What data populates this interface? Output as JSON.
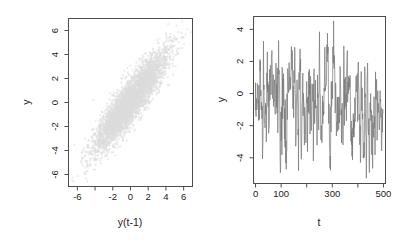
{
  "figure": {
    "background": "#ffffff",
    "axis_color": "#4d4d4d",
    "text_color": "#1a1a1a"
  },
  "panels": [
    {
      "id": "scatter",
      "x_title": "y(t-1)",
      "y_title": "y",
      "point_color": "#dcdcdc",
      "box": {
        "left": 68,
        "right": 192,
        "top": 18,
        "bottom": 186
      },
      "x_ticks": [
        -6,
        -4,
        -2,
        0,
        2,
        4,
        6
      ],
      "x_tick_labels": [
        "-6",
        "",
        "-2",
        "0",
        "2",
        "4",
        "6"
      ],
      "y_ticks": [
        -6,
        -4,
        -2,
        0,
        2,
        4,
        6
      ],
      "y_tick_labels": [
        "-6",
        "-4",
        "-2",
        "0",
        "2",
        "4",
        "6"
      ]
    },
    {
      "id": "series",
      "x_title": "t",
      "y_title": "y",
      "line_color": "#777777",
      "box": {
        "left": 253,
        "right": 385,
        "top": 16,
        "bottom": 183
      },
      "x_ticks": [
        0,
        100,
        200,
        300,
        400,
        500
      ],
      "x_tick_labels": [
        "0",
        "100",
        "",
        "300",
        "",
        "500"
      ],
      "y_ticks": [
        -4,
        -2,
        0,
        2,
        4
      ],
      "y_tick_labels": [
        "-4",
        "-2",
        "0",
        "2",
        "4"
      ]
    }
  ],
  "chart_data": [
    {
      "type": "scatter",
      "title": "",
      "xlabel": "y(t-1)",
      "ylabel": "y",
      "xlim": [
        -7.0,
        7.0
      ],
      "ylim": [
        -7.0,
        7.0
      ],
      "xticks": [
        -6,
        -4,
        -2,
        0,
        2,
        4,
        6
      ],
      "xticklabels": [
        "-6",
        "",
        "-2",
        "0",
        "2",
        "4",
        "6"
      ],
      "yticks": [
        -6,
        -4,
        -2,
        0,
        2,
        4,
        6
      ],
      "yticklabels": [
        "-6",
        "-4",
        "-2",
        "0",
        "2",
        "4",
        "6"
      ],
      "grid": false,
      "legend": false,
      "marker_color": "#dcdcdc",
      "n_points": 4000,
      "description": "Lag-1 scatter of an AR-like series: dense elongated elliptical cloud along the 1:1 diagonal, strong positive autocorrelation.",
      "lag1_correlation": 0.9,
      "marginal_sd": 2.1,
      "marginal_mean": 0.0
    },
    {
      "type": "line",
      "title": "",
      "xlabel": "t",
      "ylabel": "y",
      "xlim": [
        -8,
        508
      ],
      "ylim": [
        -5.6,
        4.8
      ],
      "xticks": [
        0,
        100,
        200,
        300,
        400,
        500
      ],
      "xticklabels": [
        "0",
        "100",
        "",
        "300",
        "",
        "500"
      ],
      "yticks": [
        -4,
        -2,
        0,
        2,
        4
      ],
      "yticklabels": [
        "-4",
        "-2",
        "0",
        "2",
        "4"
      ],
      "grid": false,
      "legend": false,
      "line_color": "#777777",
      "n_points": 500,
      "description": "Time series trace of the same AR process, t = 1..500, mean 0, fluctuating roughly between -5.3 and +4.5 with rapid oscillation.",
      "series": [
        {
          "name": "y",
          "ar1_phi": 0.62,
          "noise_sd": 1.65,
          "seed": 20240517,
          "y_min": -5.3,
          "y_max": 4.5
        }
      ]
    }
  ]
}
